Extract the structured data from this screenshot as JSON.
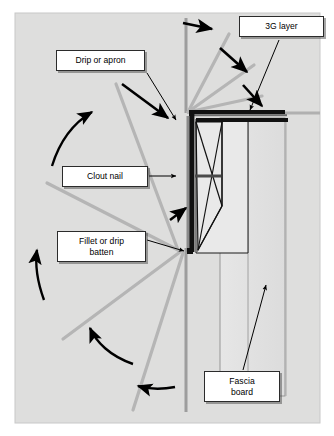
{
  "figure": {
    "background_color": "#dededd",
    "border_color": "#c9c9c9",
    "line_color_gray": "#b3b3b3",
    "line_color_black": "#000000",
    "fill_light": "#ebebeb",
    "fill_mid": "#d4d4d4"
  },
  "labels": {
    "three_g": "3G layer",
    "drip_or_apron": "Drip or apron",
    "clout_nail": "Clout nail",
    "fillet_or_drip_batten": "Fillet or drip\nbatten",
    "fillet_line1": "Fillet or drip",
    "fillet_line2": "batten",
    "fascia_line1": "Fascia",
    "fascia_line2": "board"
  },
  "callouts": [
    {
      "name": "3G layer",
      "box": [
        239,
        16,
        85,
        21
      ],
      "leader_to": [
        248,
        113
      ]
    },
    {
      "name": "Drip or apron",
      "box": [
        56,
        50,
        89,
        21
      ],
      "leader_to": [
        172,
        122
      ]
    },
    {
      "name": "Clout nail",
      "box": [
        62,
        166,
        86,
        21
      ],
      "leader_to": [
        172,
        176
      ]
    },
    {
      "name": "Fillet or drip batten",
      "box": [
        57,
        231,
        89,
        31
      ],
      "leader_to": [
        180,
        249
      ]
    },
    {
      "name": "Fascia board",
      "box": [
        204,
        371,
        76,
        31
      ],
      "leader_to": [
        263,
        291
      ]
    }
  ],
  "elements": {
    "tile_battens_count": 3,
    "left_gray_lines_count": 3,
    "curved_arrows_count": 4,
    "straight_arrows_count": 4,
    "fascia_board_rect": [
      220,
      118,
      65,
      278
    ],
    "wall_line_x": 186,
    "soffit_y": 113
  }
}
